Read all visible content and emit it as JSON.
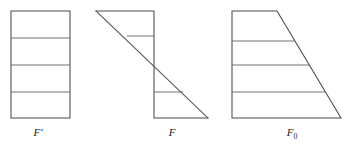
{
  "page": {
    "background_color": "#ffffff",
    "stroke_color": "#4a4a4a",
    "divider_color": "#6a6a6a",
    "label_color": "#1a1a1a"
  },
  "figures": [
    {
      "id": "figure-f-prime",
      "label": "F",
      "label_suffix": "′",
      "label_suffix_kind": "prime",
      "shape": "rectangle",
      "description": "Upright rectangle divided into four horizontal strips",
      "outline_points": "11,11 70,11 70,118 11,118",
      "divider_lines": [
        "11,38 70,38",
        "11,65 70,65",
        "11,92 70,92"
      ],
      "strip_count": 4,
      "label_x": 38,
      "label_y": 136
    },
    {
      "id": "figure-f",
      "label": "F",
      "label_suffix": "",
      "label_suffix_kind": "none",
      "shape": "zigzag-sheared",
      "description": "Sheared zigzag figure: top-left vertex with long diagonal down to bottom-right, vertical right edge of upper half and vertical left edge of lower half",
      "outline_points": "96,11 154,11 154,118 208,118",
      "diagonal_line": "96,11 208,118",
      "divider_lines": [
        "127,36 154,36",
        "154,92 183,92"
      ],
      "strip_count": 4,
      "label_x": 172,
      "label_y": 136
    },
    {
      "id": "figure-f-zero",
      "label": "F",
      "label_suffix": "0",
      "label_suffix_kind": "subscript",
      "shape": "trapezoid",
      "description": "Right trapezoid with vertical left side and slanted right side, divided into four horizontal strips",
      "outline_points": "232,11 277,11 341,118 232,118",
      "divider_lines": [
        "232,41 295,41",
        "232,65 309,65",
        "232,92 325,92"
      ],
      "strip_count": 4,
      "label_x": 292,
      "label_y": 136
    }
  ]
}
